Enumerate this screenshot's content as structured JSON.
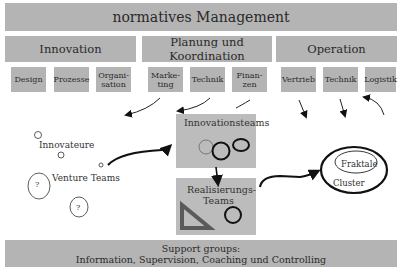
{
  "top": {
    "label": "normatives Management"
  },
  "sections": [
    {
      "label": "Innovation",
      "subs": [
        "Design",
        "Prozesse",
        "Organi-\nsation"
      ]
    },
    {
      "label": "Planung und Koordination",
      "subs": [
        "Marke-\nting",
        "Technik",
        "Finan-\nzen"
      ]
    },
    {
      "label": "Operation",
      "subs": [
        "Vertrieb",
        "Technik",
        "Logistik"
      ]
    }
  ],
  "left": {
    "innovateure": "Innovateure",
    "venture": "Venture Teams",
    "question": "?"
  },
  "center": {
    "innovationsteams": "Innovationsteams",
    "realisierung_l1": "Realisierungs-",
    "realisierung_l2": "Teams"
  },
  "right": {
    "fraktale": "Fraktale",
    "cluster": "Cluster"
  },
  "support": {
    "line1": "Support groups:",
    "line2": "Information, Supervision, Coaching und Controlling"
  }
}
